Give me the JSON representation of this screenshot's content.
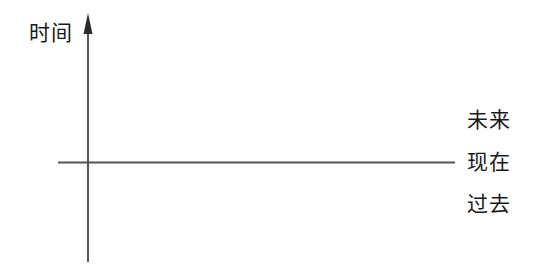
{
  "diagram": {
    "type": "time-axis-diagram",
    "background_color": "#ffffff",
    "line_color": "#555555",
    "text_color": "#1a1a1a",
    "vertical_axis": {
      "label": "时间",
      "icon": "up-arrow-icon",
      "direction": "up",
      "x": 88,
      "top": 13,
      "bottom": 262
    },
    "horizontal_axis": {
      "y": 162,
      "left": 58,
      "right": 455
    },
    "side_labels": [
      {
        "label": "未来",
        "meaning": "future",
        "y": 120
      },
      {
        "label": "现在",
        "meaning": "present",
        "y": 162
      },
      {
        "label": "过去",
        "meaning": "past",
        "y": 204
      }
    ]
  }
}
